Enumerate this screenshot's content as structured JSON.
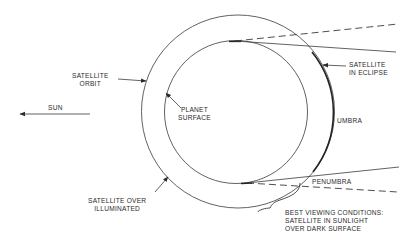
{
  "diagram": {
    "type": "satellite eclipse geometry",
    "colors": {
      "line": "#3a3a3a",
      "text": "#2a2a2a",
      "background": "#ffffff"
    },
    "labels": {
      "sun": "SUN",
      "satellite_orbit_line1": "SATELLITE",
      "satellite_orbit_line2": "ORBIT",
      "planet_surface_line1": "PLANET",
      "planet_surface_line2": "SURFACE",
      "satellite_in_eclipse_line1": "SATELLITE",
      "satellite_in_eclipse_line2": "IN ECLIPSE",
      "umbra": "UMBRA",
      "penumbra": "PENUMBRA",
      "satellite_over_illuminated_line1": "SATELLITE OVER",
      "satellite_over_illuminated_line2": "ILLUMINATED",
      "best_viewing_line1": "BEST VIEWING CONDITIONS:",
      "best_viewing_line2": "SATELLITE IN SUNLIGHT",
      "best_viewing_line3": "OVER DARK SURFACE"
    },
    "elements": {
      "planet": {
        "cx": 236,
        "cy": 112,
        "r": 71.5
      },
      "orbit": {
        "cx": 238,
        "cy": 111.5,
        "r": 96.5
      }
    }
  }
}
